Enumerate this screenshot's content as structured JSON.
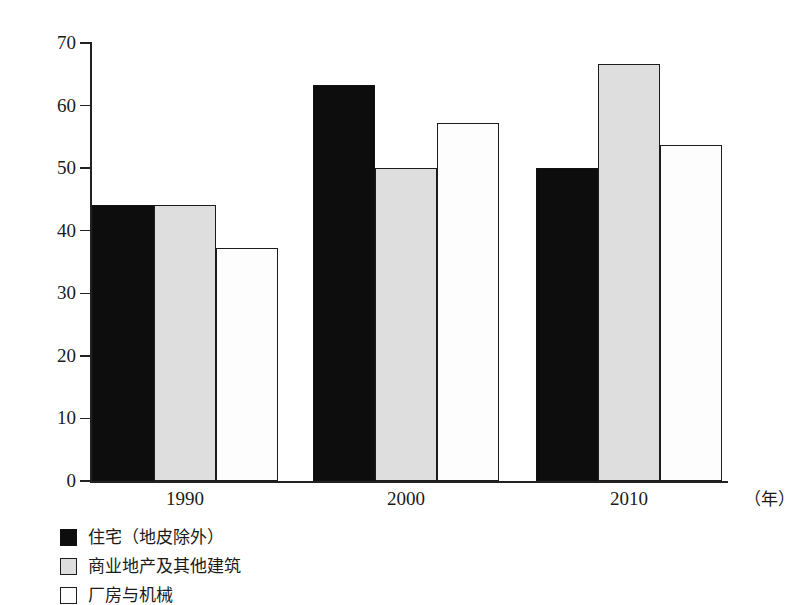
{
  "chart_data": {
    "type": "bar",
    "title": "",
    "subtitle": "",
    "xlabel": "（年）",
    "ylabel": "",
    "categories": [
      "1990",
      "2000",
      "2010"
    ],
    "series": [
      {
        "name": "住宅（地皮除外）",
        "swatch": "fill-black",
        "color": "#0d0d0d",
        "values": [
          44.1,
          63.3,
          50.0
        ]
      },
      {
        "name": "商业地产及其他建筑",
        "swatch": "fill-gray",
        "color": "#dedede",
        "values": [
          44.1,
          50.0,
          66.6
        ]
      },
      {
        "name": "厂房与机械",
        "swatch": "fill-white",
        "color": "#fdfdfd",
        "values": [
          37.2,
          57.2,
          53.7
        ]
      }
    ],
    "ylim": [
      0,
      70
    ],
    "yticks": [
      0,
      10,
      20,
      30,
      40,
      50,
      60,
      70
    ],
    "ytick_labels": [
      "0",
      "10",
      "20",
      "30",
      "40",
      "50",
      "60",
      "70"
    ],
    "grid": false,
    "legend_position": "below-left"
  },
  "axis": {
    "x_unit_label": "（年）"
  },
  "legend": {
    "items": [
      {
        "label": "住宅（地皮除外）"
      },
      {
        "label": "商业地产及其他建筑"
      },
      {
        "label": "厂房与机械"
      }
    ]
  }
}
